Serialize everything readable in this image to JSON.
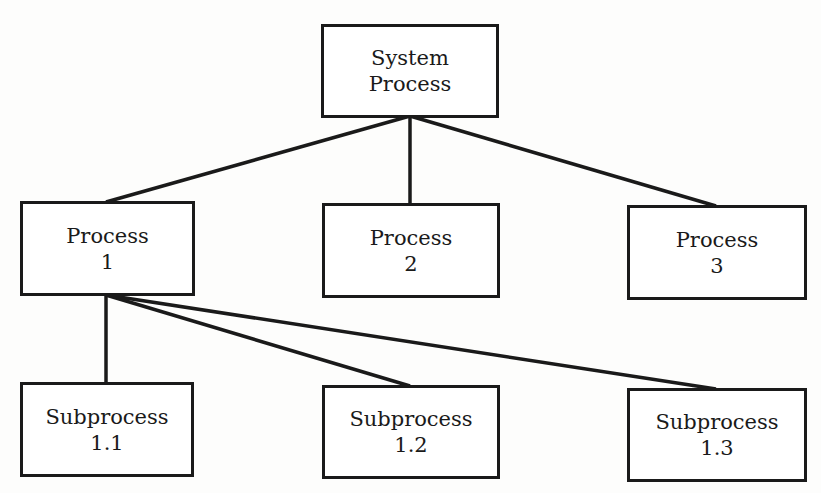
{
  "diagram": {
    "type": "hierarchy",
    "root": {
      "line1": "System",
      "line2": "Process"
    },
    "processes": [
      {
        "line1": "Process",
        "line2": "1"
      },
      {
        "line1": "Process",
        "line2": "2"
      },
      {
        "line1": "Process",
        "line2": "3"
      }
    ],
    "subprocesses": [
      {
        "line1": "Subprocess",
        "line2": "1.1"
      },
      {
        "line1": "Subprocess",
        "line2": "1.2"
      },
      {
        "line1": "Subprocess",
        "line2": "1.3"
      }
    ],
    "edges": [
      [
        "System Process",
        "Process 1"
      ],
      [
        "System Process",
        "Process 2"
      ],
      [
        "System Process",
        "Process 3"
      ],
      [
        "Process 1",
        "Subprocess 1.1"
      ],
      [
        "Process 1",
        "Subprocess 1.2"
      ],
      [
        "Process 1",
        "Subprocess 1.3"
      ]
    ]
  }
}
